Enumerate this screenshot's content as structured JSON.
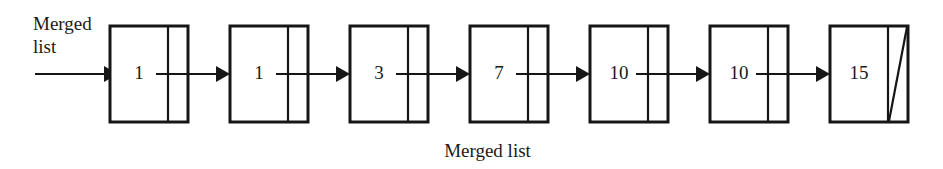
{
  "diagram": {
    "type": "singly-linked-list",
    "entry_label": "Merged\nlist",
    "caption": "Merged list",
    "colors": {
      "stroke": "#161616",
      "background": "#ffffff",
      "text": "#1a1a1a"
    },
    "nodes": [
      {
        "value": "1"
      },
      {
        "value": "1"
      },
      {
        "value": "3"
      },
      {
        "value": "7"
      },
      {
        "value": "10"
      },
      {
        "value": "10"
      },
      {
        "value": "15"
      }
    ],
    "terminator": "null-slash"
  }
}
